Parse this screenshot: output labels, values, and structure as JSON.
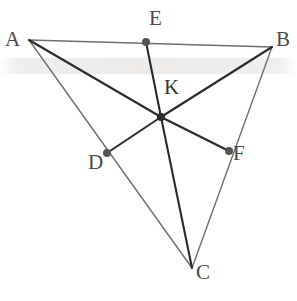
{
  "figure": {
    "width": 297,
    "height": 301,
    "background_color": "#ffffff",
    "line_color_light": "#6e6e6e",
    "line_color_dark": "#2b2b2b",
    "point_color": "#555555",
    "label_color": "#4a4a4a",
    "watermark_color": "#cbc4be"
  },
  "points": [
    {
      "id": "A",
      "label": "A",
      "x": 29,
      "y": 40,
      "label_x": 5,
      "label_y": 29,
      "dot": false,
      "role": "triangle-vertex"
    },
    {
      "id": "B",
      "label": "B",
      "x": 272,
      "y": 47,
      "label_x": 276,
      "label_y": 29,
      "dot": false,
      "role": "triangle-vertex"
    },
    {
      "id": "C",
      "label": "C",
      "x": 192,
      "y": 268,
      "label_x": 196,
      "label_y": 262,
      "dot": false,
      "role": "triangle-vertex"
    },
    {
      "id": "D",
      "label": "D",
      "x": 107,
      "y": 153,
      "label_x": 88,
      "label_y": 152,
      "dot": true,
      "role": "side-point-on-AC"
    },
    {
      "id": "E",
      "label": "E",
      "x": 146,
      "y": 42,
      "label_x": 149,
      "label_y": 8,
      "dot": true,
      "role": "side-point-on-AB"
    },
    {
      "id": "F",
      "label": "F",
      "x": 229,
      "y": 151,
      "label_x": 233,
      "label_y": 143,
      "dot": true,
      "role": "side-point-on-BC"
    },
    {
      "id": "K",
      "label": "K",
      "x": 161,
      "y": 117,
      "label_x": 164,
      "label_y": 77,
      "dot": true,
      "role": "intersection-point"
    }
  ],
  "segments": [
    {
      "id": "AB",
      "from": "A",
      "to": "B",
      "weight": "light",
      "kind": "triangle-side"
    },
    {
      "id": "AC",
      "from": "A",
      "to": "C",
      "weight": "light",
      "kind": "triangle-side"
    },
    {
      "id": "BC",
      "from": "B",
      "to": "C",
      "weight": "light",
      "kind": "triangle-side"
    },
    {
      "id": "AK",
      "from": "A",
      "to": "K",
      "weight": "dark",
      "kind": "cevian-part"
    },
    {
      "id": "KF",
      "from": "K",
      "to": "F",
      "weight": "dark",
      "kind": "cevian-part"
    },
    {
      "id": "BK",
      "from": "B",
      "to": "K",
      "weight": "dark",
      "kind": "cevian-part"
    },
    {
      "id": "KD",
      "from": "K",
      "to": "D",
      "weight": "dark",
      "kind": "cevian-part"
    },
    {
      "id": "EK",
      "from": "E",
      "to": "K",
      "weight": "dark",
      "kind": "cevian-part"
    },
    {
      "id": "KC",
      "from": "K",
      "to": "C",
      "weight": "dark",
      "kind": "cevian-part"
    }
  ],
  "cevians": [
    {
      "id": "AF",
      "label": "AF",
      "endpoints": [
        "A",
        "F"
      ],
      "through": "K"
    },
    {
      "id": "BD",
      "label": "BD",
      "endpoints": [
        "B",
        "D"
      ],
      "through": "K"
    },
    {
      "id": "CE",
      "label": "CE",
      "endpoints": [
        "C",
        "E"
      ],
      "through": "K"
    }
  ],
  "watermark": {
    "visible": true,
    "y": 58,
    "height": 16
  }
}
